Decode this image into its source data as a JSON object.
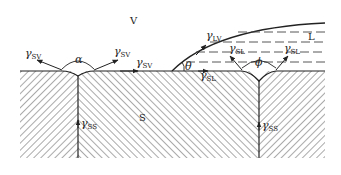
{
  "diagram": {
    "phases": {
      "vapor": "V",
      "liquid": "L",
      "solid": "S"
    },
    "tensions": {
      "gamma_symbol": "γ",
      "sv": "SV",
      "lv": "LV",
      "sl": "SL",
      "ss": "SS"
    },
    "angles": {
      "dihedral_vapor": "α",
      "contact": "θ",
      "dihedral_liquid": "ϕ"
    },
    "colors": {
      "line": "#222222",
      "hatch": "#555555",
      "dash": "#444444",
      "background": "#ffffff"
    }
  }
}
